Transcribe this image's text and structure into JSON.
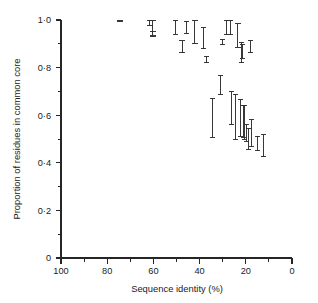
{
  "figure": {
    "background_color": "#ffffff",
    "ink_color": "#262626"
  },
  "chart_data": {
    "type": "scatter",
    "title": "",
    "subtitle": "",
    "xlabel": "Sequence identity (%)",
    "ylabel": "Proportion of residues in common core",
    "xlim": [
      100,
      0
    ],
    "ylim": [
      0,
      1.0
    ],
    "x_axis_reversed": true,
    "grid": false,
    "legend": null,
    "marker_style": "vertical-range-bar-with-end-caps",
    "x_ticks_major": [
      100,
      80,
      60,
      40,
      20,
      0
    ],
    "x_tick_labels": [
      "100",
      "80",
      "60",
      "40",
      "20",
      "0"
    ],
    "x_ticks_minor": [
      90,
      70,
      50,
      30,
      10
    ],
    "y_ticks_major": [
      0,
      0.2,
      0.4,
      0.6,
      0.8,
      1.0
    ],
    "y_tick_labels": [
      "0",
      "0·2",
      "0·4",
      "0·6",
      "0·8",
      "1·0"
    ],
    "y_ticks_minor": [
      0.1,
      0.3,
      0.5,
      0.7,
      0.9
    ],
    "points": [
      {
        "x": 74.5,
        "y_low": 0.992,
        "y_high": 0.998
      },
      {
        "x": 61.5,
        "y_low": 0.975,
        "y_high": 1.0
      },
      {
        "x": 60.2,
        "y_low": 0.935,
        "y_high": 1.0
      },
      {
        "x": 60.2,
        "y_low": 0.93,
        "y_high": 0.952
      },
      {
        "x": 50.5,
        "y_low": 0.94,
        "y_high": 0.998
      },
      {
        "x": 47.6,
        "y_low": 0.862,
        "y_high": 0.912
      },
      {
        "x": 45.8,
        "y_low": 0.945,
        "y_high": 0.995
      },
      {
        "x": 42.0,
        "y_low": 0.9,
        "y_high": 0.998
      },
      {
        "x": 38.3,
        "y_low": 0.88,
        "y_high": 0.968
      },
      {
        "x": 37.0,
        "y_low": 0.82,
        "y_high": 0.845
      },
      {
        "x": 34.5,
        "y_low": 0.508,
        "y_high": 0.672
      },
      {
        "x": 31.0,
        "y_low": 0.688,
        "y_high": 0.768
      },
      {
        "x": 30.2,
        "y_low": 0.897,
        "y_high": 0.918
      },
      {
        "x": 28.2,
        "y_low": 0.94,
        "y_high": 1.0
      },
      {
        "x": 26.8,
        "y_low": 0.938,
        "y_high": 1.0
      },
      {
        "x": 26.3,
        "y_low": 0.56,
        "y_high": 0.698
      },
      {
        "x": 24.3,
        "y_low": 0.5,
        "y_high": 0.688
      },
      {
        "x": 23.4,
        "y_low": 0.885,
        "y_high": 0.985
      },
      {
        "x": 22.4,
        "y_low": 0.512,
        "y_high": 0.665
      },
      {
        "x": 21.8,
        "y_low": 0.82,
        "y_high": 0.905
      },
      {
        "x": 21.5,
        "y_low": 0.838,
        "y_high": 0.898
      },
      {
        "x": 21.0,
        "y_low": 0.508,
        "y_high": 0.64
      },
      {
        "x": 20.4,
        "y_low": 0.5,
        "y_high": 0.64
      },
      {
        "x": 19.8,
        "y_low": 0.49,
        "y_high": 0.56
      },
      {
        "x": 19.0,
        "y_low": 0.455,
        "y_high": 0.545
      },
      {
        "x": 17.8,
        "y_low": 0.862,
        "y_high": 0.912
      },
      {
        "x": 17.6,
        "y_low": 0.47,
        "y_high": 0.58
      },
      {
        "x": 15.0,
        "y_low": 0.452,
        "y_high": 0.512
      },
      {
        "x": 12.2,
        "y_low": 0.425,
        "y_high": 0.518
      }
    ]
  }
}
